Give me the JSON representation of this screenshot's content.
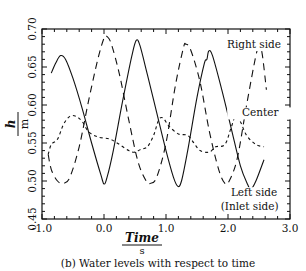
{
  "chart_data": {
    "type": "line",
    "title": "(b) Water levels with respect to time",
    "xlabel": "Time",
    "xlabel_unit": "s",
    "ylabel": "h",
    "ylabel_unit": "m",
    "xlim": [
      -1.0,
      3.0
    ],
    "ylim": [
      0.45,
      0.7
    ],
    "xticks": [
      "-1.0",
      "0.0",
      "1.0",
      "2.0",
      "3.0"
    ],
    "yticks": [
      "0.45",
      "0.50",
      "0.55",
      "0.60",
      "0.65",
      "0.70"
    ],
    "grid": false,
    "legend_position": "inline annotations",
    "series": [
      {
        "name": "Left side (Inlet side)",
        "style": "solid",
        "x": [
          -0.85,
          -0.78,
          -0.7,
          -0.62,
          -0.5,
          -0.35,
          -0.2,
          -0.05,
          0.0,
          0.05,
          0.15,
          0.3,
          0.45,
          0.52,
          0.58,
          0.7,
          0.85,
          1.0,
          1.12,
          1.19,
          1.25,
          1.35,
          1.5,
          1.62,
          1.66,
          1.69,
          1.75,
          1.9,
          2.05,
          2.2,
          2.32,
          2.37,
          2.45,
          2.58
        ],
        "y": [
          0.642,
          0.655,
          0.665,
          0.66,
          0.635,
          0.595,
          0.55,
          0.508,
          0.496,
          0.505,
          0.54,
          0.605,
          0.665,
          0.685,
          0.678,
          0.64,
          0.59,
          0.54,
          0.505,
          0.493,
          0.5,
          0.54,
          0.61,
          0.655,
          0.66,
          0.671,
          0.665,
          0.62,
          0.57,
          0.52,
          0.495,
          0.489,
          0.5,
          0.528
        ]
      },
      {
        "name": "Right side",
        "style": "long-dash",
        "x": [
          -0.9,
          -0.85,
          -0.75,
          -0.65,
          -0.55,
          -0.4,
          -0.25,
          -0.1,
          0.0,
          0.05,
          0.12,
          0.25,
          0.4,
          0.55,
          0.68,
          0.75,
          0.85,
          1.0,
          1.15,
          1.28,
          1.32,
          1.4,
          1.55,
          1.7,
          1.85,
          1.95,
          2.02,
          2.15,
          2.3,
          2.45,
          2.5,
          2.55,
          2.62
        ],
        "y": [
          0.535,
          0.515,
          0.5,
          0.497,
          0.505,
          0.545,
          0.605,
          0.66,
          0.688,
          0.69,
          0.68,
          0.64,
          0.58,
          0.525,
          0.5,
          0.497,
          0.505,
          0.55,
          0.625,
          0.675,
          0.68,
          0.672,
          0.63,
          0.565,
          0.515,
          0.497,
          0.5,
          0.53,
          0.6,
          0.665,
          0.675,
          0.668,
          0.62
        ]
      },
      {
        "name": "Center",
        "style": "short-dash",
        "x": [
          -0.9,
          -0.85,
          -0.75,
          -0.65,
          -0.55,
          -0.45,
          -0.35,
          -0.25,
          -0.1,
          0.1,
          0.25,
          0.4,
          0.5,
          0.6,
          0.7,
          0.8,
          0.88,
          0.95,
          1.05,
          1.2,
          1.35,
          1.45,
          1.55,
          1.7,
          1.8,
          1.95,
          2.05,
          2.12,
          2.2,
          2.3,
          2.45,
          2.58
        ],
        "y": [
          0.535,
          0.548,
          0.555,
          0.575,
          0.585,
          0.585,
          0.578,
          0.565,
          0.558,
          0.555,
          0.548,
          0.54,
          0.538,
          0.542,
          0.545,
          0.56,
          0.58,
          0.583,
          0.572,
          0.562,
          0.56,
          0.55,
          0.54,
          0.538,
          0.545,
          0.548,
          0.57,
          0.585,
          0.578,
          0.56,
          0.548,
          0.545
        ]
      }
    ],
    "annotations": [
      {
        "text": "Right side",
        "x": 2.42,
        "y": 0.675
      },
      {
        "text": "Center",
        "x": 2.52,
        "y": 0.585
      },
      {
        "text": "Left side",
        "x": 2.42,
        "y": 0.48
      },
      {
        "text": "(Inlet side)",
        "x": 2.35,
        "y": 0.462
      }
    ]
  }
}
